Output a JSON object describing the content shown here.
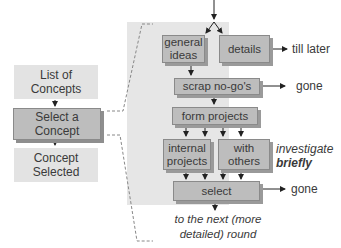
{
  "left_flow": {
    "top": "List of Concepts",
    "middle": "Select a Concept",
    "bottom": "Concept Selected"
  },
  "detail_flow": {
    "general_ideas": "general ideas",
    "details": "details",
    "scrap": "scrap no-go's",
    "form_projects": "form projects",
    "internal_projects": "internal projects",
    "with_others": "with others",
    "select": "select"
  },
  "outcomes": {
    "details_out": "till later",
    "scrap_out": "gone",
    "select_out": "gone",
    "investigate_1": "investigate",
    "investigate_2": "briefly",
    "next_round_1": "to the next (more",
    "next_round_2": "detailed) round"
  },
  "colors": {
    "panel": "#e6e6e6",
    "box": "#bdbdbd",
    "box_shadow": "#9a9a9a",
    "left_box": "#e3e3e3",
    "text": "#3a3a3a"
  }
}
